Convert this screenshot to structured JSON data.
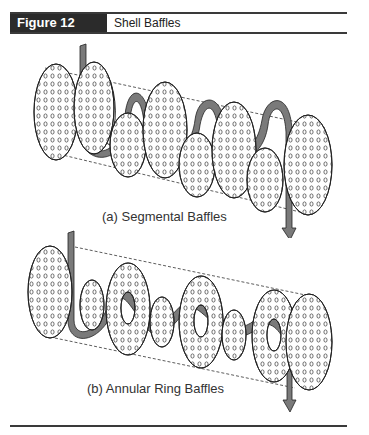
{
  "figure": {
    "label": "Figure 12",
    "title": "Shell Baffles"
  },
  "diagrams": [
    {
      "id": "segmental",
      "caption": "(a) Segmental Baffles",
      "baffle_type": "segmental",
      "plates": 7,
      "flow": "serpentine shell-side flow arrow passing alternately over/under half-disc baffles"
    },
    {
      "id": "annular",
      "caption": "(b) Annular Ring Baffles",
      "baffle_type": "annular ring / disc",
      "plates": 7,
      "flow": "shell-side flow arrow weaving through ring holes and around discs"
    }
  ],
  "colors": {
    "header_bg": "#2b2b2b",
    "arrow_fill": "#7a7a7a",
    "outline": "#222222",
    "plate_fill": "#ffffff"
  }
}
